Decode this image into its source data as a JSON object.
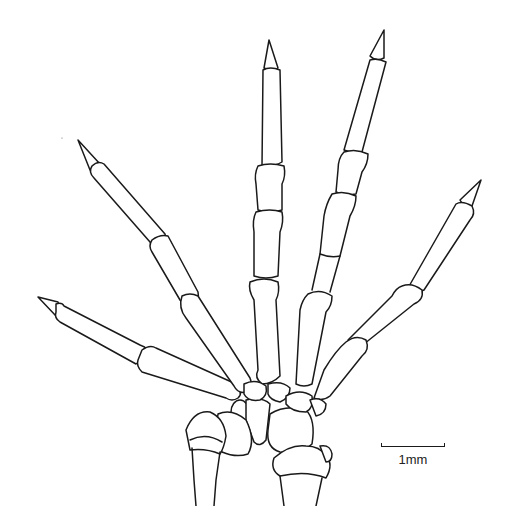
{
  "figure": {
    "digits": [
      {
        "id": "digit-1",
        "name": "first digit (leftmost)",
        "phalanges": 2,
        "has_claw": true
      },
      {
        "id": "digit-2",
        "name": "second digit",
        "phalanges": 3,
        "has_claw": true
      },
      {
        "id": "digit-3",
        "name": "third digit (middle)",
        "phalanges": 4,
        "has_claw": true
      },
      {
        "id": "digit-4",
        "name": "fourth digit",
        "phalanges": 4,
        "has_claw": true
      },
      {
        "id": "digit-5",
        "name": "fifth digit (rightmost)",
        "phalanges": 3,
        "has_claw": true
      }
    ],
    "lower_elements": [
      "radius",
      "ulna",
      "carpals"
    ],
    "colors": {
      "line": "#1a1a1a",
      "background": "#ffffff"
    }
  },
  "scale_bar": {
    "label": "1mm",
    "length_px": 64
  }
}
